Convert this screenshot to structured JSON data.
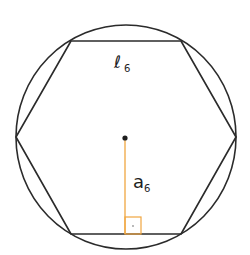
{
  "diagram": {
    "labels": {
      "side": {
        "main": "ℓ",
        "sub": "6"
      },
      "apothem": {
        "main": "a",
        "sub": "6"
      }
    },
    "colors": {
      "stroke": "#2b2b2b",
      "apothem": "#f0a640",
      "background": "#ffffff"
    },
    "geometry": {
      "circle": {
        "cx": 126,
        "cy": 137,
        "r": 111
      },
      "hexagon_vertices": [
        [
          71,
          41
        ],
        [
          181,
          41
        ],
        [
          236,
          137
        ],
        [
          181,
          234
        ],
        [
          71,
          234
        ],
        [
          16,
          137
        ]
      ],
      "center": [
        125,
        138
      ],
      "apothem_foot": [
        125,
        234
      ],
      "right_angle_marker": {
        "x": 125,
        "y": 217,
        "size": 16
      }
    }
  }
}
